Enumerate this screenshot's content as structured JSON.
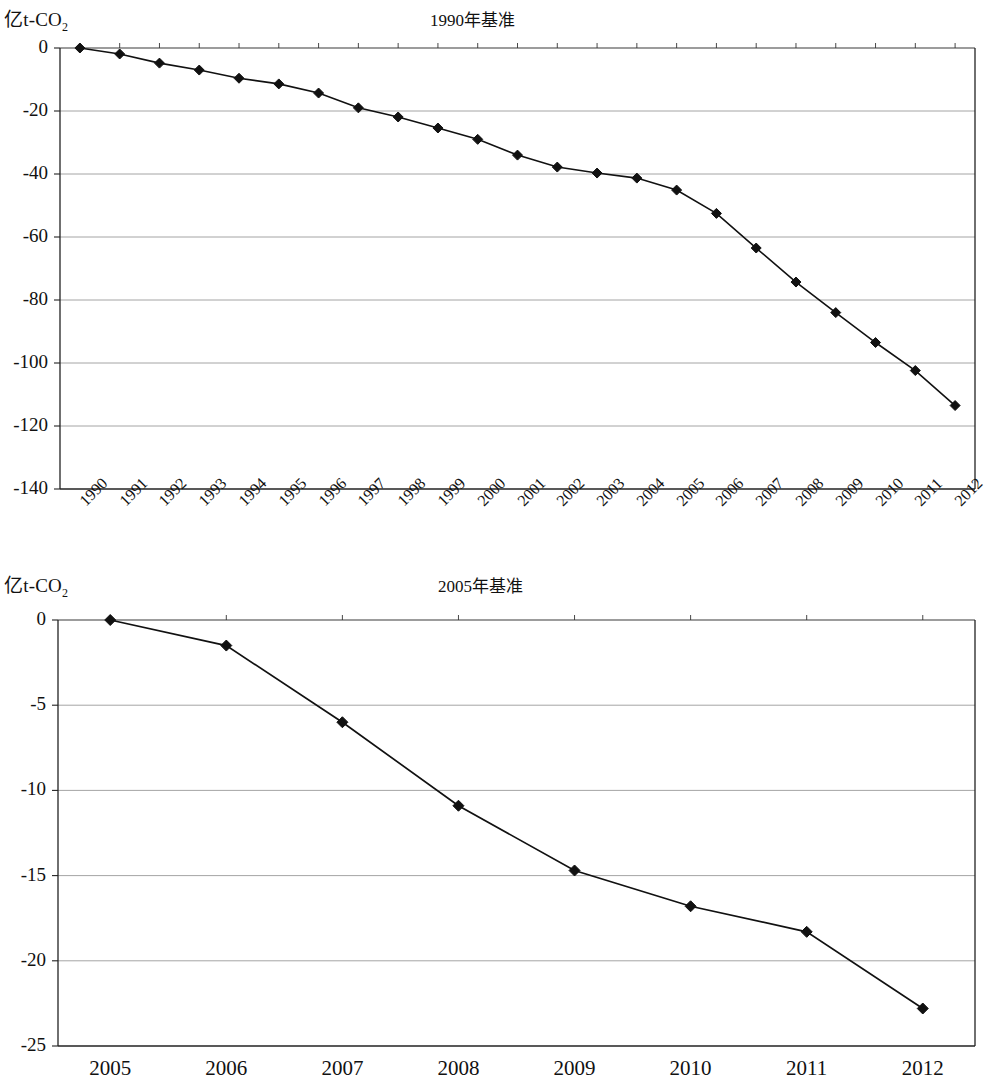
{
  "charts": [
    {
      "id": "chart1",
      "title": "1990年基准",
      "ylabel_main": "亿t-CO",
      "ylabel_sub": "2",
      "ytick_labels": [
        "0",
        "-20",
        "-40",
        "-60",
        "-80",
        "-100",
        "-120",
        "-140"
      ],
      "xtick_labels": [
        "1990",
        "1991",
        "1992",
        "1993",
        "1994",
        "1995",
        "1996",
        "1997",
        "1998",
        "1999",
        "2000",
        "2001",
        "2002",
        "2003",
        "2004",
        "2005",
        "2006",
        "2007",
        "2008",
        "2009",
        "2010",
        "2011",
        "2012"
      ]
    },
    {
      "id": "chart2",
      "title": "2005年基准",
      "ylabel_main": "亿t-CO",
      "ylabel_sub": "2",
      "ytick_labels": [
        "0",
        "-5",
        "-10",
        "-15",
        "-20",
        "-25"
      ],
      "xtick_labels": [
        "2005",
        "2006",
        "2007",
        "2008",
        "2009",
        "2010",
        "2011",
        "2012"
      ]
    }
  ],
  "chart_data": [
    {
      "type": "line",
      "title": "1990年基准",
      "xlabel": "",
      "ylabel": "亿t-CO2",
      "ylim": [
        -140,
        0
      ],
      "yticks": [
        0,
        -20,
        -40,
        -60,
        -80,
        -100,
        -120,
        -140
      ],
      "grid": true,
      "legend": "none",
      "marker": "diamond",
      "line_color": "#000000",
      "categories": [
        "1990",
        "1991",
        "1992",
        "1993",
        "1994",
        "1995",
        "1996",
        "1997",
        "1998",
        "1999",
        "2000",
        "2001",
        "2002",
        "2003",
        "2004",
        "2005",
        "2006",
        "2007",
        "2008",
        "2009",
        "2010",
        "2011",
        "2012"
      ],
      "values": [
        0.0,
        -1.9,
        -4.8,
        -7.0,
        -9.6,
        -11.4,
        -14.3,
        -19.0,
        -21.9,
        -25.4,
        -29.0,
        -34.0,
        -37.8,
        -39.7,
        -41.3,
        -45.1,
        -52.5,
        -63.5,
        -74.3,
        -84.0,
        -93.5,
        -102.4,
        -113.5
      ]
    },
    {
      "type": "line",
      "title": "2005年基准",
      "xlabel": "",
      "ylabel": "亿t-CO2",
      "ylim": [
        -25,
        0
      ],
      "yticks": [
        0,
        -5,
        -10,
        -15,
        -20,
        -25
      ],
      "grid": true,
      "legend": "none",
      "marker": "diamond",
      "line_color": "#000000",
      "categories": [
        "2005",
        "2006",
        "2007",
        "2008",
        "2009",
        "2010",
        "2011",
        "2012"
      ],
      "values": [
        0.0,
        -1.5,
        -6.0,
        -10.9,
        -14.7,
        -16.8,
        -18.3,
        -22.8
      ]
    }
  ]
}
